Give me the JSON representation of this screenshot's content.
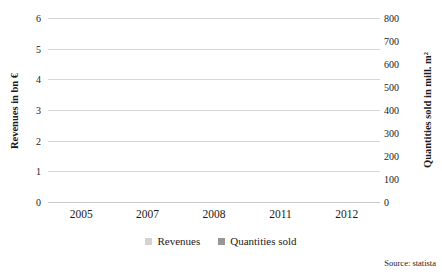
{
  "chart_data": {
    "type": "bar",
    "title": "",
    "categories": [
      "2005",
      "2007",
      "2008",
      "2011",
      "2012"
    ],
    "series": [
      {
        "name": "Revenues",
        "axis": "left",
        "color": "#d2d2d2",
        "values": [
          null,
          5.6,
          5.35,
          null,
          4.75
        ]
      },
      {
        "name": "Quantities sold",
        "axis": "right",
        "color": "#969696",
        "values": [
          500,
          null,
          700,
          645,
          null
        ]
      }
    ],
    "left_axis": {
      "label": "Revenues in bn €",
      "min": 0,
      "max": 6,
      "ticks": [
        0,
        1,
        2,
        3,
        4,
        5,
        6
      ]
    },
    "right_axis": {
      "label": "Quantities sold in mill. m²",
      "min": 0,
      "max": 800,
      "ticks": [
        0,
        100,
        200,
        300,
        400,
        500,
        600,
        700,
        800
      ]
    },
    "grid": true,
    "legend_position": "bottom"
  },
  "source": {
    "text": "Source: statista"
  },
  "colors": {
    "gridline": "#d8d8d8",
    "text": "#1a1a1a",
    "background": "#ffffff"
  }
}
